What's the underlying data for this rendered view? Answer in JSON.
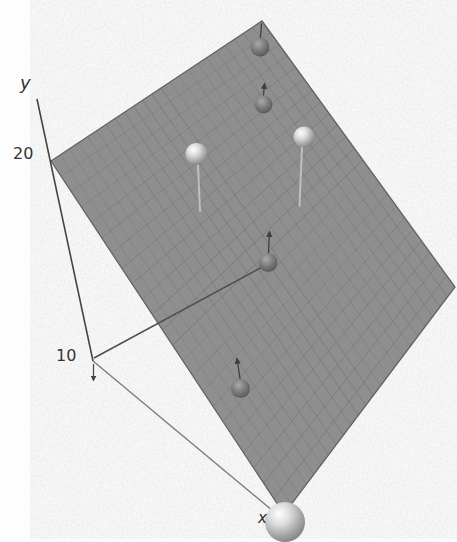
{
  "chart_data": {
    "type": "scatter",
    "projection": "3d",
    "title": "",
    "y_axis": {
      "label": "y",
      "ticks": [
        "20",
        "10"
      ]
    },
    "x_axis": {
      "label": "x"
    },
    "colors": {
      "background": "#fdfdfd",
      "plane_fill": "#909090",
      "plane_grid": "#696969",
      "plane_edge": "#606060",
      "axis_dark": "#454545",
      "axis_light": "#7b7b7b",
      "residual_dark": "#3f3f3f",
      "residual_light": "#c8c8c8",
      "label_color": "#343434"
    },
    "plane": {
      "corners_px": {
        "left": [
          51,
          161
        ],
        "top": [
          262,
          21
        ],
        "right": [
          455,
          287
        ],
        "bottom": [
          284,
          514
        ]
      },
      "grid_cells": 23
    },
    "lines_px": {
      "y_axis": [
        37,
        99,
        93,
        361
      ],
      "x_axis": [
        93,
        361,
        285,
        521
      ],
      "origin_to_point": [
        94,
        358,
        264,
        266
      ],
      "origin_down_arrow": [
        93.5,
        364,
        93.5,
        380
      ]
    },
    "points_px": [
      {
        "x": 260,
        "y": 47,
        "r": 9.5,
        "position": "below_plane",
        "shade": "dark",
        "residual": {
          "x1": 261.5,
          "y1": 24,
          "x2": 260.5,
          "y2": 37.5,
          "style": "dark",
          "arrow": false
        }
      },
      {
        "x": 263.5,
        "y": 104.5,
        "r": 9,
        "position": "below_plane",
        "shade": "dark",
        "residual": {
          "x1": 264.5,
          "y1": 84,
          "x2": 263.5,
          "y2": 95,
          "style": "dark",
          "arrow": true
        }
      },
      {
        "x": 304,
        "y": 137,
        "r": 10.5,
        "position": "above_plane",
        "shade": "bright",
        "residual": {
          "x1": 302,
          "y1": 147,
          "x2": 299.5,
          "y2": 206,
          "style": "light",
          "arrow": false
        }
      },
      {
        "x": 196.5,
        "y": 154,
        "r": 11,
        "position": "above_plane",
        "shade": "bright",
        "residual": {
          "x1": 198,
          "y1": 165,
          "x2": 200,
          "y2": 211,
          "style": "light",
          "arrow": false
        }
      },
      {
        "x": 268,
        "y": 262.5,
        "r": 9.5,
        "position": "below_plane",
        "shade": "dark",
        "residual": {
          "x1": 269.5,
          "y1": 232,
          "x2": 268.5,
          "y2": 252.5,
          "style": "dark",
          "arrow": true
        }
      },
      {
        "x": 240.5,
        "y": 388.5,
        "r": 9.5,
        "position": "below_plane",
        "shade": "dark",
        "residual": {
          "x1": 237,
          "y1": 359,
          "x2": 240,
          "y2": 378.5,
          "style": "dark",
          "arrow": true
        }
      },
      {
        "x": 285,
        "y": 522,
        "r": 20,
        "position": "front_axis_end",
        "shade": "bright",
        "residual": null
      }
    ]
  }
}
